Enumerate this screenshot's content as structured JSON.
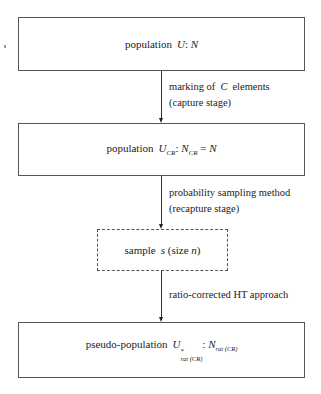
{
  "diagram": {
    "type": "flowchart",
    "direction": "top-to-bottom",
    "nodes": [
      {
        "id": "population",
        "style": "solid",
        "label": {
          "prefix": "population",
          "symbol": "U",
          "sep": ":",
          "value": "N"
        },
        "text": "population U: N"
      },
      {
        "id": "population-cr",
        "style": "solid",
        "label": {
          "prefix": "population",
          "symbol": "U",
          "symbol_sub": "CR",
          "sep": ":",
          "value": "N",
          "value_sub": "CR",
          "eq": "=",
          "rhs": "N"
        },
        "text": "population U_CR: N_CR = N"
      },
      {
        "id": "sample",
        "style": "dashed",
        "label": {
          "prefix": "sample",
          "symbol": "s",
          "paren_open": "(size",
          "size": "n",
          "paren_close": ")"
        },
        "text": "sample s (size n)"
      },
      {
        "id": "pseudo-population",
        "style": "solid",
        "label": {
          "prefix": "pseudo-population",
          "symbol": "U",
          "symbol_sup": "*",
          "symbol_sub": "rat (CR)",
          "sep": ":",
          "value": "N",
          "value_sub": "rat (CR)"
        },
        "text": "pseudo-population U*_rat(CR): N_rat(CR)"
      }
    ],
    "edges": [
      {
        "from": "population",
        "to": "population-cr",
        "line1": {
          "pre": "marking of",
          "symbol": "C",
          "post": "elements"
        },
        "line2": "(capture stage)"
      },
      {
        "from": "population-cr",
        "to": "sample",
        "line1": "probability sampling method",
        "line2": "(recapture stage)"
      },
      {
        "from": "sample",
        "to": "pseudo-population",
        "line1": "ratio-corrected HT approach"
      }
    ]
  }
}
